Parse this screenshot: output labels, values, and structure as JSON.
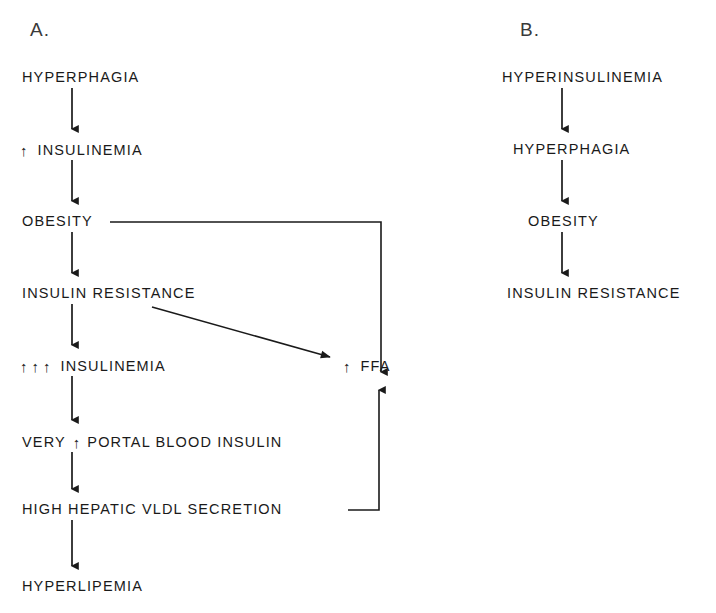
{
  "figure": {
    "background_color": "#ffffff",
    "ink_color": "#1a1a1a",
    "panels": [
      {
        "id": "A",
        "label": "A."
      },
      {
        "id": "B",
        "label": "B."
      }
    ]
  },
  "panel_a": {
    "label": "A.",
    "nodes": [
      {
        "id": "a1",
        "text": "HYPERPHAGIA",
        "arrows": 0
      },
      {
        "id": "a2",
        "text": "INSULINEMIA",
        "arrows": 1,
        "arrow_glyph": "↑",
        "prefix": ""
      },
      {
        "id": "a3",
        "text": "OBESITY",
        "arrows": 0
      },
      {
        "id": "a4",
        "text": "INSULIN  RESISTANCE",
        "arrows": 0
      },
      {
        "id": "a5",
        "text": "INSULINEMIA",
        "arrows": 3,
        "arrow_glyph": "↑",
        "prefix": ""
      },
      {
        "id": "a6",
        "text": "PORTAL  BLOOD  INSULIN",
        "arrows": 1,
        "arrow_glyph": "↑",
        "prefix": "VERY"
      },
      {
        "id": "a7",
        "text": "HIGH  HEPATIC   VLDL  SECRETION",
        "arrows": 0
      },
      {
        "id": "a8",
        "text": "HYPERLIPEMIA",
        "arrows": 0
      },
      {
        "id": "a9",
        "text": "FFA",
        "arrows": 1,
        "arrow_glyph": "↑",
        "prefix": ""
      }
    ],
    "edges": [
      {
        "from": "a1",
        "to": "a2",
        "kind": "vertical-arrow"
      },
      {
        "from": "a2",
        "to": "a3",
        "kind": "vertical-arrow"
      },
      {
        "from": "a3",
        "to": "a4",
        "kind": "vertical-arrow"
      },
      {
        "from": "a4",
        "to": "a5",
        "kind": "vertical-arrow"
      },
      {
        "from": "a5",
        "to": "a6",
        "kind": "vertical-arrow"
      },
      {
        "from": "a6",
        "to": "a7",
        "kind": "vertical-arrow"
      },
      {
        "from": "a7",
        "to": "a8",
        "kind": "vertical-arrow"
      },
      {
        "from": "a4",
        "to": "a9",
        "kind": "diagonal-arrow"
      },
      {
        "from": "a3",
        "to": "a9",
        "kind": "elbow-down-arrow"
      },
      {
        "from": "a7",
        "to": "a9",
        "kind": "elbow-up-arrow"
      }
    ]
  },
  "panel_b": {
    "label": "B.",
    "nodes": [
      {
        "id": "b1",
        "text": "HYPERINSULINEMIA",
        "arrows": 0
      },
      {
        "id": "b2",
        "text": "HYPERPHAGIA",
        "arrows": 0
      },
      {
        "id": "b3",
        "text": "OBESITY",
        "arrows": 0
      },
      {
        "id": "b4",
        "text": "INSULIN  RESISTANCE",
        "arrows": 0
      }
    ],
    "edges": [
      {
        "from": "b1",
        "to": "b2",
        "kind": "vertical-arrow"
      },
      {
        "from": "b2",
        "to": "b3",
        "kind": "vertical-arrow"
      },
      {
        "from": "b3",
        "to": "b4",
        "kind": "vertical-arrow"
      }
    ]
  }
}
